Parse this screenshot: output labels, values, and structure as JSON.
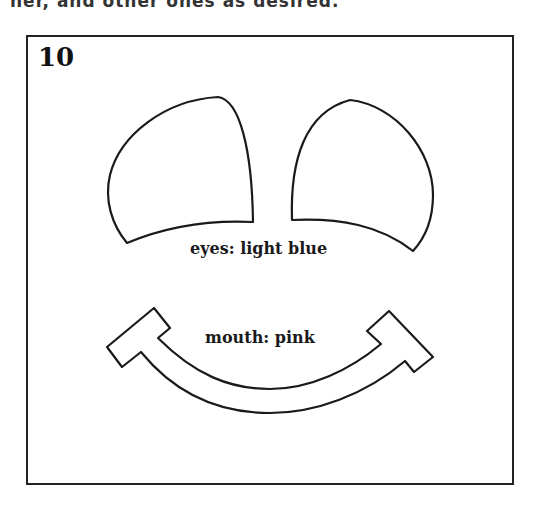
{
  "header": {
    "clipped_text": "ner, and other ones as desired."
  },
  "panel": {
    "number": "10",
    "eyes_label": "eyes: light blue",
    "mouth_label": "mouth: pink"
  },
  "colors": {
    "stroke": "#1a1a1a",
    "background": "#ffffff"
  }
}
